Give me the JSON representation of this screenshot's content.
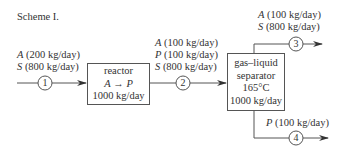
{
  "title": "Scheme I.",
  "units": {
    "reactor": {
      "name": "reactor",
      "reaction_from": "A",
      "arrow": "→",
      "reaction_to": "P",
      "capacity": "1000 kg/day"
    },
    "separator": {
      "name_line1": "gas–liquid",
      "name_line2": "separator",
      "temperature": "165°C",
      "capacity": "1000 kg/day"
    }
  },
  "streams": [
    {
      "id": "1",
      "components": [
        {
          "species": "A",
          "rate": "(200 kg/day)"
        },
        {
          "species": "S",
          "rate": "(800 kg/day)"
        }
      ]
    },
    {
      "id": "2",
      "components": [
        {
          "species": "A",
          "rate": "(100 kg/day)"
        },
        {
          "species": "P",
          "rate": "(100 kg/day)"
        },
        {
          "species": "S",
          "rate": "(800 kg/day)"
        }
      ]
    },
    {
      "id": "3",
      "components": [
        {
          "species": "A",
          "rate": "(100 kg/day)"
        },
        {
          "species": "S",
          "rate": "(800 kg/day)"
        }
      ]
    },
    {
      "id": "4",
      "components": [
        {
          "species": "P",
          "rate": "(100 kg/day)"
        }
      ]
    }
  ],
  "colors": {
    "line": "#555555",
    "text": "#333333"
  }
}
